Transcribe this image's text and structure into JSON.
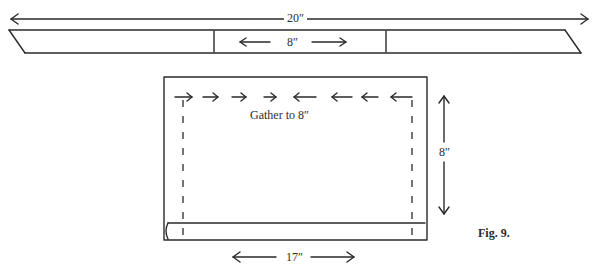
{
  "figure": {
    "caption": "Fig. 9.",
    "type": "sewing pattern diagram"
  },
  "strip": {
    "total_length_label": "20″",
    "center_section_label": "8″"
  },
  "panel": {
    "gather_instruction": "Gather to 8″",
    "height_label": "8″",
    "width_label": "17″",
    "gather_arrows": [
      "right",
      "right",
      "right",
      "right",
      "left",
      "left",
      "left",
      "left"
    ]
  },
  "colors": {
    "ink": "#2a2a2a",
    "background": "#ffffff"
  }
}
